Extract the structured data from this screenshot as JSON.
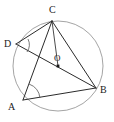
{
  "figure": {
    "canvas": {
      "width": 114,
      "height": 122
    },
    "background_color": "#ffffff",
    "circle_color": "#9a9a9a",
    "line_color": "#2b2b2b",
    "label_color": "#1a1a1a"
  },
  "circle": {
    "center_label": "O",
    "center_x": 58,
    "center_y": 66,
    "radius": 45
  },
  "points": [
    {
      "id": "C",
      "label": "C",
      "x": 52,
      "y": 21,
      "label_x": 49,
      "label_y": 13
    },
    {
      "id": "D",
      "label": "D",
      "x": 16,
      "y": 44,
      "label_x": 4,
      "label_y": 47
    },
    {
      "id": "A",
      "label": "A",
      "x": 23,
      "y": 100,
      "label_x": 8,
      "label_y": 110
    },
    {
      "id": "B",
      "label": "B",
      "x": 96,
      "y": 88,
      "label_x": 100,
      "label_y": 93
    }
  ],
  "segments": [
    {
      "id": "DC",
      "from": "D",
      "to": "C"
    },
    {
      "id": "DB",
      "from": "D",
      "to": "B"
    },
    {
      "id": "CA",
      "from": "C",
      "to": "A"
    },
    {
      "id": "CB",
      "from": "C",
      "to": "B"
    },
    {
      "id": "AB",
      "from": "A",
      "to": "B"
    },
    {
      "id": "CO",
      "from": "C",
      "to": "O"
    }
  ],
  "angle_marks": [
    {
      "id": "angle-D",
      "vertex": "D",
      "description": "angle CDB"
    },
    {
      "id": "angle-A",
      "vertex": "A",
      "description": "angle CAB"
    }
  ],
  "labels": {
    "C": "C",
    "D": "D",
    "A": "A",
    "B": "B",
    "O": "O"
  }
}
